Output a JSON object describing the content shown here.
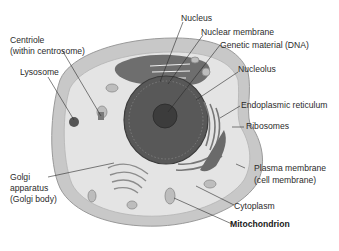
{
  "diagram": {
    "type": "labeled-illustration",
    "labels": [
      {
        "id": "nucleus",
        "text": "Nucleus"
      },
      {
        "id": "nuclear_membrane",
        "text": "Nuclear membrane"
      },
      {
        "id": "genetic_material",
        "text": "Genetic material (DNA)"
      },
      {
        "id": "centriole_1",
        "text": "Centriole"
      },
      {
        "id": "centriole_2",
        "text": "(within centrosome)"
      },
      {
        "id": "lysosome",
        "text": "Lysosome"
      },
      {
        "id": "nucleolus",
        "text": "Nucleolus"
      },
      {
        "id": "er",
        "text": "Endoplasmic reticulum"
      },
      {
        "id": "ribosomes",
        "text": "Ribosomes"
      },
      {
        "id": "plasma_1",
        "text": "Plasma membrane"
      },
      {
        "id": "plasma_2",
        "text": "(cell membrane)"
      },
      {
        "id": "golgi_1",
        "text": "Golgi"
      },
      {
        "id": "golgi_2",
        "text": "apparatus"
      },
      {
        "id": "golgi_3",
        "text": "(Golgi body)"
      },
      {
        "id": "cytoplasm",
        "text": "Cytoplasm"
      },
      {
        "id": "mitochondrion",
        "text": "Mitochondrion"
      }
    ],
    "colors": {
      "background": "#ffffff",
      "cell_outer": "#c9c9c9",
      "cytoplasm": "#e3e3e3",
      "nucleus": "#5a5a5a",
      "nucleolus": "#3e3e3e",
      "leader_line": "#2a2a2a",
      "text": "#2b2b2b"
    }
  }
}
